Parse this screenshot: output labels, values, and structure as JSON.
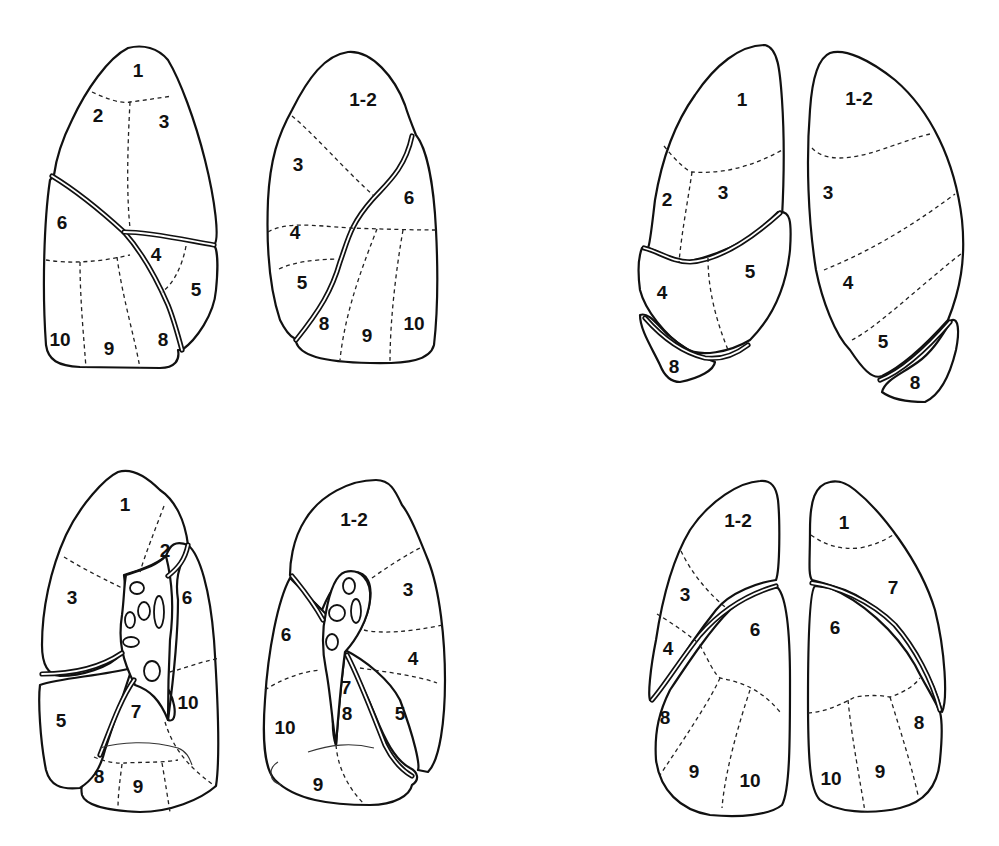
{
  "figure": {
    "colors": {
      "line": "#111111",
      "background": "#ffffff"
    },
    "views": [
      {
        "id": "top-left-right-lung-lateral",
        "labels": [
          "1",
          "2",
          "3",
          "6",
          "4",
          "5",
          "10",
          "9",
          "8"
        ]
      },
      {
        "id": "top-middle-left-lung-lateral",
        "labels": [
          "1-2",
          "3",
          "6",
          "4",
          "5",
          "8",
          "9",
          "10"
        ]
      },
      {
        "id": "top-right-right-lung-anterior",
        "labels": [
          "1",
          "2",
          "3",
          "4",
          "5",
          "8"
        ]
      },
      {
        "id": "top-far-right-left-lung-anterior",
        "labels": [
          "1-2",
          "3",
          "4",
          "5",
          "8"
        ]
      },
      {
        "id": "bottom-left-right-lung-medial",
        "labels": [
          "1",
          "2",
          "3",
          "6",
          "5",
          "7",
          "10",
          "8",
          "9"
        ]
      },
      {
        "id": "bottom-middle-left-lung-medial",
        "labels": [
          "1-2",
          "3",
          "6",
          "4",
          "7",
          "10",
          "8",
          "5",
          "9"
        ]
      },
      {
        "id": "bottom-right-left-lung-posterior",
        "labels": [
          "1-2",
          "3",
          "6",
          "4",
          "8",
          "9",
          "10"
        ]
      },
      {
        "id": "bottom-far-right-right-lung-posterior",
        "labels": [
          "1",
          "7",
          "6",
          "8",
          "10",
          "9"
        ]
      }
    ]
  }
}
